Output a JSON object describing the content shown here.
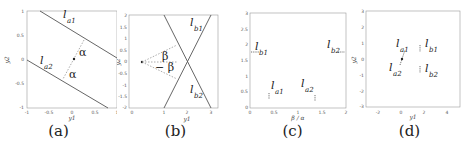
{
  "panels": [
    {
      "caption": "(a)",
      "xlabel": "y1",
      "ylabel": "y2",
      "xticks": [
        "-1",
        "-0.5",
        "0",
        "0.5",
        "1"
      ],
      "yticks": [
        "1",
        "0.5",
        "0",
        "-0.5",
        "-1"
      ],
      "lines": [
        {
          "label": "l",
          "sub": "a1"
        },
        {
          "label": "l",
          "sub": "a2"
        }
      ],
      "angle_labels": [
        "α",
        "α"
      ]
    },
    {
      "caption": "(b)",
      "xlabel": "y1",
      "ylabel": "y2",
      "xticks": [
        "0",
        "1",
        "2",
        "3"
      ],
      "yticks": [
        "2",
        "1.5",
        "1",
        "0.5",
        "0",
        "-0.5",
        "-1",
        "-1.5",
        "-2"
      ],
      "lines": [
        {
          "label": "l",
          "sub": "b1"
        },
        {
          "label": "l",
          "sub": "b2"
        }
      ],
      "angle_labels": [
        "β",
        "− β"
      ]
    },
    {
      "caption": "(c)",
      "xlabel": "β / α",
      "ylabel": "",
      "xticks": [
        "0",
        "0.5",
        "1",
        "1.5",
        "2"
      ],
      "yticks": [
        "3",
        "2.5",
        "2",
        "1.5",
        "1",
        "0.5",
        "0"
      ],
      "points": [
        {
          "label": "l",
          "sub": "b1"
        },
        {
          "label": "l",
          "sub": "b2"
        },
        {
          "label": "l",
          "sub": "a1"
        },
        {
          "label": "l",
          "sub": "a2"
        }
      ]
    },
    {
      "caption": "(d)",
      "xlabel": "y1",
      "ylabel": "y2",
      "xticks": [
        "-2",
        "0",
        "2",
        "4"
      ],
      "yticks": [
        "3",
        "2",
        "1",
        "0",
        "-1",
        "-2",
        "-3"
      ],
      "points": [
        {
          "label": "l",
          "sub": "a1"
        },
        {
          "label": "l",
          "sub": "b1"
        },
        {
          "label": "l",
          "sub": "a2"
        },
        {
          "label": "l",
          "sub": "b2"
        }
      ]
    }
  ]
}
